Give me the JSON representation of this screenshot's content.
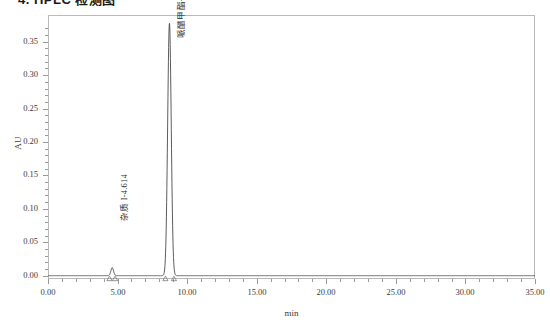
{
  "page": {
    "title": "4. HPLC 检测图"
  },
  "chart_data": {
    "type": "line",
    "title": "",
    "subtitle": "",
    "xlabel": "min",
    "ylabel": "AU",
    "xlim": [
      0.0,
      35.0
    ],
    "ylim": [
      -0.005,
      0.39
    ],
    "grid": false,
    "legend": null,
    "xticks": [
      "0.00",
      "5.00",
      "10.00",
      "15.00",
      "20.00",
      "25.00",
      "30.00",
      "35.00"
    ],
    "xtick_values": [
      0,
      5,
      10,
      15,
      20,
      25,
      30,
      35
    ],
    "yticks": [
      "0.00",
      "0.05",
      "0.10",
      "0.15",
      "0.20",
      "0.25",
      "0.30",
      "0.35"
    ],
    "ytick_values": [
      0.0,
      0.05,
      0.1,
      0.15,
      0.2,
      0.25,
      0.3,
      0.35
    ],
    "series": [
      {
        "name": "chromatogram",
        "color": "#4a4a4a",
        "baseline": 0.0
      }
    ],
    "peaks": [
      {
        "label": "杂质 I-4.614",
        "name": "杂质 I",
        "retention_time": 4.614,
        "height": 0.012,
        "width": 0.22,
        "marker_left": 4.42,
        "marker_right": 4.82
      },
      {
        "label": "哌醋甲酯-8.728",
        "name": "哌醋甲酯",
        "retention_time": 8.728,
        "height": 0.378,
        "width": 0.3,
        "marker_left": 8.44,
        "marker_right": 9.05
      }
    ],
    "annotations": [
      {
        "text": "杂质 I-4.614",
        "x": 4.614,
        "y": 0.082
      },
      {
        "text": "哌醋甲酯-8.728",
        "x": 8.728,
        "y": 0.355
      }
    ]
  }
}
